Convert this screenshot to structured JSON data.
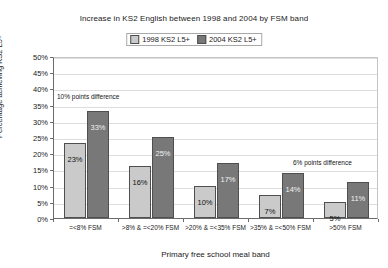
{
  "chart_data": {
    "type": "bar",
    "title": "Increase in KS2 English between 1998 and 2004 by FSM band",
    "xlabel": "Primary free school meal band",
    "ylabel": "Percentage achieving KS2 L5+",
    "ylim": [
      0,
      50
    ],
    "ytick_labels": [
      "50%",
      "45%",
      "40%",
      "35%",
      "30%",
      "25%",
      "20%",
      "15%",
      "10%",
      "5%",
      "0%"
    ],
    "ytick_values": [
      50,
      45,
      40,
      35,
      30,
      25,
      20,
      15,
      10,
      5,
      0
    ],
    "grid": true,
    "legend_position": "top-center",
    "categories": [
      "=<8% FSM",
      ">8% & =<20% FSM",
      ">20% & =<35% FSM",
      ">35% & =<50% FSM",
      ">50% FSM"
    ],
    "series": [
      {
        "name": "1998 KS2 L5+",
        "color": "#cacaca",
        "values": [
          23,
          16,
          10,
          7,
          5
        ],
        "labels": [
          "23%",
          "16%",
          "10%",
          "7%",
          "5%"
        ]
      },
      {
        "name": "2004 KS2 L5+",
        "color": "#787878",
        "values": [
          33,
          25,
          17,
          14,
          11
        ],
        "labels": [
          "33%",
          "25%",
          "17%",
          "14%",
          "11%"
        ]
      }
    ],
    "annotations": [
      {
        "text": "10% points difference",
        "position": "above-group-1"
      },
      {
        "text": "6% points difference",
        "position": "above-group-5"
      }
    ]
  },
  "legend": {
    "items": [
      {
        "label": "1998 KS2 L5+"
      },
      {
        "label": "2004 KS2 L5+"
      }
    ]
  }
}
